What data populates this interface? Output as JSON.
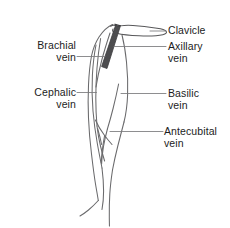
{
  "figure": {
    "background_color": "#ffffff",
    "ink_color": "#58585a",
    "text_color": "#1c1c1c",
    "vein_highlight_color": "#4d4d4f"
  },
  "labels": {
    "brachial": {
      "line1": "Brachial",
      "line2": "vein"
    },
    "cephalic": {
      "line1": "Cephalic",
      "line2": "vein"
    },
    "clavicle": {
      "line1": "Clavicle"
    },
    "axillary": {
      "line1": "Axillary",
      "line2": "vein"
    },
    "basilic": {
      "line1": "Basilic",
      "line2": "vein"
    },
    "antecubital": {
      "line1": "Antecubital",
      "line2": "vein"
    }
  },
  "structures": [
    {
      "name": "clavicle",
      "kind": "bone",
      "side": "right"
    },
    {
      "name": "axillary-vein",
      "kind": "vein",
      "side": "right",
      "emphasis": "dark-band"
    },
    {
      "name": "brachial-vein",
      "kind": "vein",
      "side": "left"
    },
    {
      "name": "cephalic-vein",
      "kind": "vein",
      "side": "left"
    },
    {
      "name": "basilic-vein",
      "kind": "vein",
      "side": "right"
    },
    {
      "name": "antecubital-vein",
      "kind": "vein",
      "side": "right"
    },
    {
      "name": "arm-outline",
      "kind": "outline",
      "side": "center"
    }
  ]
}
